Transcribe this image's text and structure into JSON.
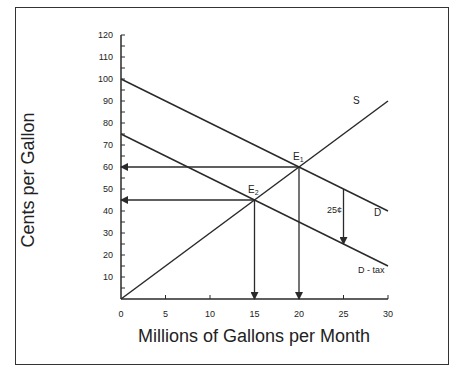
{
  "chart_data": {
    "type": "line",
    "title": "",
    "xlabel": "Millions of Gallons per Month",
    "ylabel": "Cents per Gallon",
    "xlim": [
      0,
      30
    ],
    "ylim": [
      0,
      120
    ],
    "x_ticks": [
      0,
      5,
      10,
      15,
      20,
      25,
      30
    ],
    "y_ticks": [
      10,
      20,
      30,
      40,
      50,
      60,
      70,
      80,
      90,
      100,
      110,
      120
    ],
    "y_minor_step": 5,
    "grid": false,
    "series": [
      {
        "name": "S",
        "label": "S",
        "x": [
          0,
          30
        ],
        "y": [
          0,
          90
        ]
      },
      {
        "name": "D",
        "label": "D",
        "x": [
          0,
          30
        ],
        "y": [
          100,
          40
        ]
      },
      {
        "name": "D - tax",
        "label": "D - tax",
        "x": [
          0,
          30
        ],
        "y": [
          75,
          15
        ]
      }
    ],
    "points": [
      {
        "label": "E1",
        "x": 20,
        "y": 60
      },
      {
        "label": "E2",
        "x": 15,
        "y": 45
      }
    ],
    "annotations": [
      {
        "type": "arrow",
        "from": [
          20,
          60
        ],
        "to": [
          0,
          60
        ],
        "note": "price arrow to y-axis"
      },
      {
        "type": "arrow",
        "from": [
          15,
          45
        ],
        "to": [
          0,
          45
        ],
        "note": "price arrow to y-axis"
      },
      {
        "type": "arrow",
        "from": [
          20,
          60
        ],
        "to": [
          20,
          0
        ],
        "note": "quantity arrow to x-axis"
      },
      {
        "type": "arrow",
        "from": [
          15,
          45
        ],
        "to": [
          15,
          0
        ],
        "note": "quantity arrow to x-axis"
      },
      {
        "type": "arrow",
        "from": [
          25,
          50
        ],
        "to": [
          25,
          25
        ],
        "label": "25¢"
      }
    ]
  },
  "labels": {
    "x_axis": "Millions of Gallons per Month",
    "y_axis": "Cents per Gallon",
    "supply": "S",
    "demand": "D",
    "demand_tax": "D - tax",
    "e1_base": "E",
    "e1_sub": "1",
    "e2_base": "E",
    "e2_sub": "2",
    "tax_amount": "25¢"
  },
  "colors": {
    "line": "#2a2a2a",
    "text": "#222222",
    "background": "#ffffff"
  }
}
